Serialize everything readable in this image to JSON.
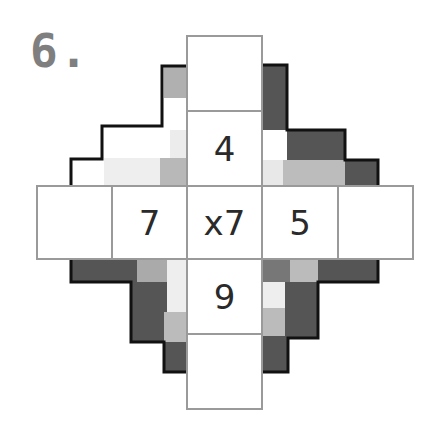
{
  "puzzle": {
    "number_label": "6.",
    "type": "cross multiplication grid",
    "center_label": "x7",
    "cells": [
      {
        "id": "top-outer",
        "value": ""
      },
      {
        "id": "top-inner",
        "value": "4"
      },
      {
        "id": "left-outer",
        "value": ""
      },
      {
        "id": "left-inner",
        "value": "7"
      },
      {
        "id": "center",
        "value": "x7"
      },
      {
        "id": "right-inner",
        "value": "5"
      },
      {
        "id": "right-outer",
        "value": ""
      },
      {
        "id": "bottom-inner",
        "value": "9"
      },
      {
        "id": "bottom-outer",
        "value": ""
      }
    ]
  },
  "colors": {
    "title": "#7f7f7f",
    "grid_line": "#9a9a9a",
    "outline": "#111111",
    "dark": "#555555",
    "mid_dark": "#777777",
    "mid": "#b4b4b4",
    "light": "#ececec"
  }
}
